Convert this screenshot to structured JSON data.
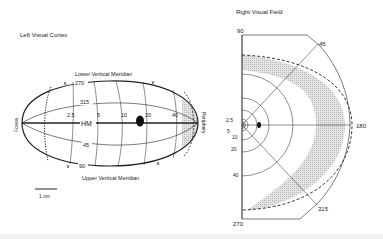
{
  "left_panel": {
    "title": "Left Visual Cortex",
    "top_label": "Lower Vertical Meridian",
    "bottom_label": "Upper Vertical Meridian",
    "left_end_label": "Fovea",
    "right_end_label": "Periphery",
    "meridian_labels": [
      "270",
      "315",
      "HM",
      "45",
      "90"
    ],
    "eccentricity_labels": [
      "2.5",
      "5",
      "10",
      "20",
      "40"
    ],
    "scale_bar_label": "1 cm"
  },
  "right_panel": {
    "title": "Right Visual Field",
    "angle_labels": {
      "top": "90",
      "diag_up": "45",
      "horizontal": "180",
      "diag_down": "315",
      "bottom": "270"
    },
    "radius_labels": [
      "2.5",
      "5",
      "10",
      "20",
      "40"
    ]
  },
  "colors": {
    "line": "#222222",
    "shading": "#d4d4d4",
    "background": "#ffffff"
  }
}
